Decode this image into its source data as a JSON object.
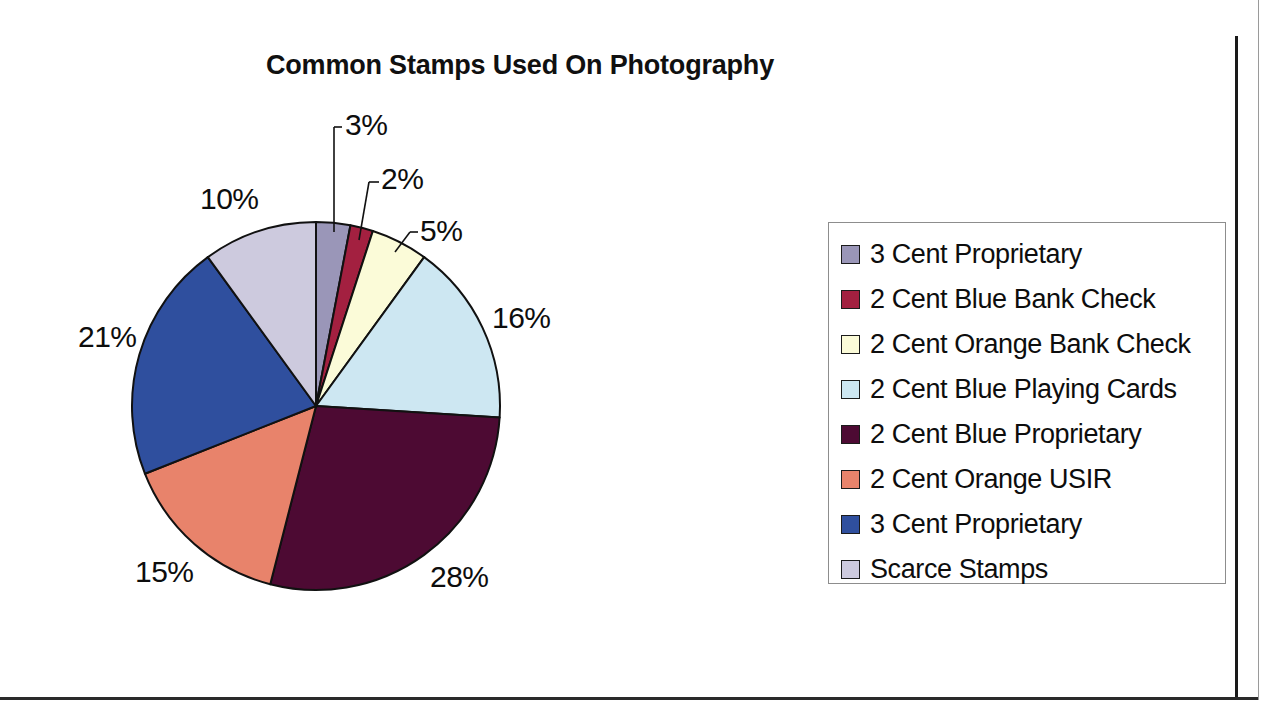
{
  "chart_data": {
    "type": "pie",
    "title": "Common Stamps Used On Photography",
    "xlabel": "",
    "ylabel": "",
    "legend_position": "right",
    "grid": false,
    "start_angle_deg": 0,
    "direction": "clockwise",
    "categories": [
      "3 Cent Proprietary",
      "2 Cent Blue Bank Check",
      "2 Cent Orange Bank Check",
      "2 Cent Blue Playing Cards",
      "2 Cent Blue Proprietary",
      "2 Cent Orange USIR",
      "3 Cent Proprietary",
      "Scarce Stamps"
    ],
    "values": [
      3,
      2,
      5,
      16,
      28,
      15,
      21,
      10
    ],
    "value_labels": [
      "3%",
      "2%",
      "5%",
      "16%",
      "28%",
      "15%",
      "21%",
      "10%"
    ],
    "colors": [
      "#9a96b8",
      "#a32040",
      "#fbfbd8",
      "#cde7f2",
      "#4d0a33",
      "#e8836b",
      "#2f4f9e",
      "#cdcade"
    ],
    "slice_border_color": "#111111"
  },
  "title": {
    "text": "Common Stamps Used On Photography"
  },
  "legend": {
    "items": [
      {
        "label": "3 Cent Proprietary",
        "color": "#9a96b8"
      },
      {
        "label": "2 Cent Blue Bank Check",
        "color": "#a32040"
      },
      {
        "label": "2 Cent Orange Bank Check",
        "color": "#fbfbd8"
      },
      {
        "label": "2 Cent Blue Playing Cards",
        "color": "#cde7f2"
      },
      {
        "label": "2 Cent Blue Proprietary",
        "color": "#4d0a33"
      },
      {
        "label": "2 Cent Orange USIR",
        "color": "#e8836b"
      },
      {
        "label": "3 Cent Proprietary",
        "color": "#2f4f9e"
      },
      {
        "label": "Scarce Stamps",
        "color": "#cdcade"
      }
    ]
  },
  "pie_labels": [
    {
      "text": "3%",
      "left": 345,
      "top": 108
    },
    {
      "text": "2%",
      "left": 381,
      "top": 162
    },
    {
      "text": "5%",
      "left": 420,
      "top": 214
    },
    {
      "text": "16%",
      "left": 492,
      "top": 301
    },
    {
      "text": "28%",
      "left": 430,
      "top": 560
    },
    {
      "text": "15%",
      "left": 135,
      "top": 555
    },
    {
      "text": "21%",
      "left": 78,
      "top": 320
    },
    {
      "text": "10%",
      "left": 200,
      "top": 182
    }
  ]
}
